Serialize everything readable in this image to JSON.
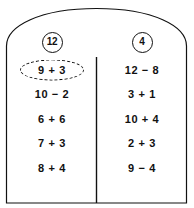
{
  "worksheet": {
    "title": "Sorting addition and subtraction expressions by answer",
    "frame_shape": "arched-rectangle",
    "line_color": "#111111",
    "background_color": "#ffffff",
    "columns": [
      {
        "id": "left",
        "header": "12",
        "header_shape": "circle",
        "expressions": [
          {
            "text": "9 + 3",
            "circled": true,
            "circle_style": "dashed-ellipse"
          },
          {
            "text": "10 − 2",
            "circled": false
          },
          {
            "text": "6 + 6",
            "circled": false
          },
          {
            "text": "7 + 3",
            "circled": false
          },
          {
            "text": "8 + 4",
            "circled": false
          }
        ]
      },
      {
        "id": "right",
        "header": "4",
        "header_shape": "circle",
        "expressions": [
          {
            "text": "12 − 8",
            "circled": false
          },
          {
            "text": "3 + 1",
            "circled": false
          },
          {
            "text": "10 + 4",
            "circled": false
          },
          {
            "text": "2 + 3",
            "circled": false
          },
          {
            "text": "9 − 4",
            "circled": false
          }
        ]
      }
    ]
  }
}
